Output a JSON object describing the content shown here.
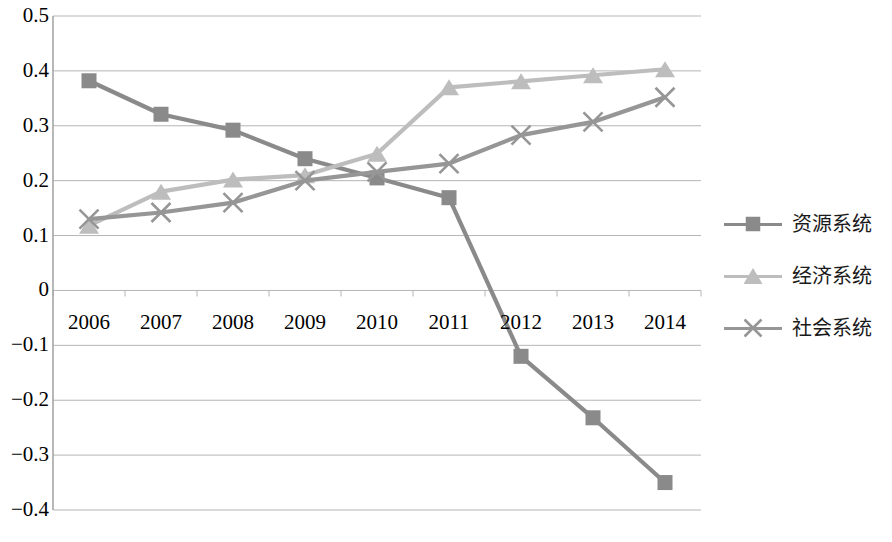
{
  "chart_data": {
    "type": "line",
    "title": "",
    "subtitle": "",
    "xlabel": "",
    "ylabel": "",
    "categories": [
      "2006",
      "2007",
      "2008",
      "2009",
      "2010",
      "2011",
      "2012",
      "2013",
      "2014"
    ],
    "x": [
      2006,
      2007,
      2008,
      2009,
      2010,
      2011,
      2012,
      2013,
      2014
    ],
    "ylim": [
      -0.4,
      0.5
    ],
    "ytick_labels": [
      "0.5",
      "0.4",
      "0.3",
      "0.2",
      "0.1",
      "0",
      "−0.1",
      "−0.2",
      "−0.3",
      "−0.4"
    ],
    "ytick_values": [
      0.5,
      0.4,
      0.3,
      0.2,
      0.1,
      0,
      -0.1,
      -0.2,
      -0.3,
      -0.4
    ],
    "grid": true,
    "grid_axis": "y",
    "legend_position": "right",
    "series": [
      {
        "name": "资源系统",
        "marker": "square",
        "color": "#8a8a8a",
        "values": [
          0.382,
          0.321,
          0.292,
          0.24,
          0.205,
          0.169,
          -0.12,
          -0.232,
          -0.35
        ]
      },
      {
        "name": "经济系统",
        "marker": "triangle",
        "color": "#bdbdbd",
        "values": [
          0.118,
          0.18,
          0.202,
          0.21,
          0.249,
          0.37,
          0.381,
          0.392,
          0.403
        ]
      },
      {
        "name": "社会系统",
        "marker": "x",
        "color": "#969696",
        "values": [
          0.13,
          0.142,
          0.16,
          0.2,
          0.216,
          0.231,
          0.283,
          0.307,
          0.352
        ]
      }
    ]
  },
  "axes": {
    "axis_color": "#a6a6a6",
    "grid_color": "#b5b5b5"
  },
  "legend": {
    "items": [
      {
        "label": "资源系统"
      },
      {
        "label": "经济系统"
      },
      {
        "label": "社会系统"
      }
    ]
  }
}
